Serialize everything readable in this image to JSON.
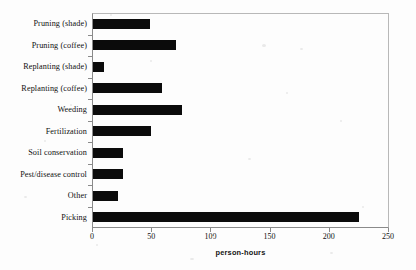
{
  "chart_data": {
    "type": "bar",
    "orientation": "horizontal",
    "title": "",
    "xlabel": "person-hours",
    "ylabel": "",
    "xlim": [
      0,
      250
    ],
    "xticks": [
      0,
      50,
      100,
      150,
      200,
      250
    ],
    "grid": false,
    "legend": null,
    "bar_color": "#0b0b0b",
    "categories": [
      "Pruning (shade)",
      "Pruning (coffee)",
      "Replanting (shade)",
      "Replanting (coffee)",
      "Weeding",
      "Fertilization",
      "Soil conservation",
      "Pest/disease control",
      "Other",
      "Picking"
    ],
    "values": [
      48,
      70,
      9,
      58,
      75,
      49,
      25,
      25,
      21,
      225
    ]
  }
}
